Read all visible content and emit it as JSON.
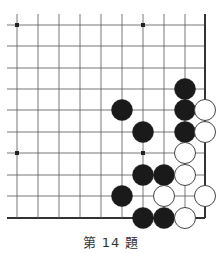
{
  "problem": {
    "caption": "第 14 題",
    "number": 14
  },
  "board": {
    "cols_x": [
      17,
      38,
      59,
      80,
      101,
      122,
      143,
      164,
      185,
      205
    ],
    "rows_y": [
      25,
      46,
      68,
      89,
      110,
      132,
      153,
      175,
      196,
      218
    ],
    "edges": [
      "right",
      "bottom"
    ],
    "line_color": "#555555",
    "edge_color": "#333333",
    "star_points": [
      [
        0,
        0
      ],
      [
        6,
        0
      ],
      [
        0,
        6
      ],
      [
        6,
        6
      ]
    ],
    "stones": [
      {
        "color": "black",
        "col": 8,
        "row": 3
      },
      {
        "color": "black",
        "col": 5,
        "row": 4
      },
      {
        "color": "black",
        "col": 8,
        "row": 4
      },
      {
        "color": "white",
        "col": 9,
        "row": 4
      },
      {
        "color": "black",
        "col": 6,
        "row": 5
      },
      {
        "color": "black",
        "col": 8,
        "row": 5
      },
      {
        "color": "white",
        "col": 9,
        "row": 5
      },
      {
        "color": "white",
        "col": 8,
        "row": 6
      },
      {
        "color": "black",
        "col": 6,
        "row": 7
      },
      {
        "color": "black",
        "col": 7,
        "row": 7
      },
      {
        "color": "white",
        "col": 8,
        "row": 7
      },
      {
        "color": "black",
        "col": 5,
        "row": 8
      },
      {
        "color": "white",
        "col": 7,
        "row": 8
      },
      {
        "color": "white",
        "col": 9,
        "row": 8
      },
      {
        "color": "black",
        "col": 6,
        "row": 9
      },
      {
        "color": "black",
        "col": 7,
        "row": 9
      },
      {
        "color": "white",
        "col": 8,
        "row": 9
      }
    ]
  }
}
